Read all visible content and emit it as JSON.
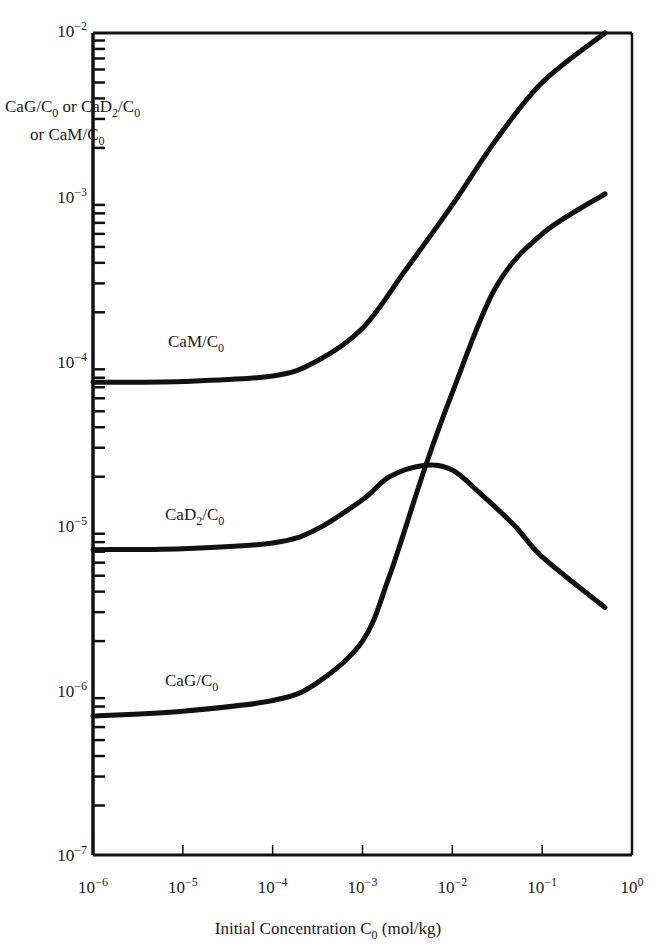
{
  "chart_data": {
    "type": "line",
    "title": "",
    "xlabel": "Initial Concentration C0 (mol/kg)",
    "xlabel_parts": {
      "main": "Initial Concentration C",
      "sub": "0",
      "tail": " (mol/kg)"
    },
    "ylabel": "CaG/C0 or CaD2/C0 or CaM/C0",
    "ylabel_lines": [
      [
        {
          "t": "CaG/C"
        },
        {
          "t": "0",
          "sub": true
        },
        {
          "t": " or CaD"
        },
        {
          "t": "2",
          "sub": true
        },
        {
          "t": "/C"
        },
        {
          "t": "0",
          "sub": true
        }
      ],
      [
        {
          "t": "or CaM/C"
        },
        {
          "t": "0",
          "sub": true
        }
      ]
    ],
    "xscale": "log",
    "yscale": "log",
    "xlim": [
      1e-06,
      1
    ],
    "ylim": [
      1e-07,
      0.01
    ],
    "grid": false,
    "legend": "inline labels",
    "x_ticks": [
      {
        "base": "10",
        "exp": "−6",
        "value": 1e-06
      },
      {
        "base": "10",
        "exp": "−5",
        "value": 1e-05
      },
      {
        "base": "10",
        "exp": "−4",
        "value": 0.0001
      },
      {
        "base": "10",
        "exp": "−3",
        "value": 0.001
      },
      {
        "base": "10",
        "exp": "−2",
        "value": 0.01
      },
      {
        "base": "10",
        "exp": "−1",
        "value": 0.1
      },
      {
        "base": "10",
        "exp": "0",
        "value": 1
      }
    ],
    "y_ticks": [
      {
        "base": "10",
        "exp": "−2",
        "value": 0.01
      },
      {
        "base": "10",
        "exp": "−3",
        "value": 0.001
      },
      {
        "base": "10",
        "exp": "−4",
        "value": 0.0001
      },
      {
        "base": "10",
        "exp": "−5",
        "value": 1e-05
      },
      {
        "base": "10",
        "exp": "−6",
        "value": 1e-06
      },
      {
        "base": "10",
        "exp": "−7",
        "value": 1e-07
      }
    ],
    "series": [
      {
        "name": "CaM/C0",
        "label_main": "CaM/C",
        "label_sub": "0",
        "label_pos": {
          "x": 168,
          "y": 347
        },
        "x": [
          1e-06,
          1e-05,
          0.0001,
          0.0003,
          0.001,
          0.003,
          0.01,
          0.03,
          0.1,
          0.5
        ],
        "values": [
          7.5e-05,
          7.6e-05,
          8.2e-05,
          0.0001,
          0.00016,
          0.00036,
          0.0009,
          0.0022,
          0.005,
          0.01
        ]
      },
      {
        "name": "CaD2/C0",
        "label_main": "CaD",
        "label_sub2": "2",
        "label_mid": "/C",
        "label_sub": "0",
        "label_pos": {
          "x": 165,
          "y": 520
        },
        "x": [
          1e-06,
          1e-05,
          0.0001,
          0.0003,
          0.001,
          0.002,
          0.005,
          0.01,
          0.02,
          0.05,
          0.1,
          0.5
        ],
        "values": [
          7.2e-06,
          7.3e-06,
          7.9e-06,
          9.5e-06,
          1.45e-05,
          2e-05,
          2.35e-05,
          2.2e-05,
          1.6e-05,
          1e-05,
          6.5e-06,
          3.2e-06
        ]
      },
      {
        "name": "CaG/C0",
        "label_main": "CaG/C",
        "label_sub": "0",
        "label_pos": {
          "x": 165,
          "y": 686
        },
        "x": [
          1e-06,
          1e-05,
          0.0001,
          0.0003,
          0.001,
          0.002,
          0.005,
          0.01,
          0.03,
          0.1,
          0.5
        ],
        "values": [
          7e-07,
          7.5e-07,
          8.7e-07,
          1.1e-06,
          2e-06,
          5e-06,
          2.3e-05,
          6.5e-05,
          0.00028,
          0.0006,
          0.00105
        ]
      }
    ]
  },
  "plot_area": {
    "left": 93,
    "right": 632,
    "top": 33,
    "bottom": 855
  },
  "colors": {
    "line": "#111111",
    "background": "#ffffff"
  }
}
